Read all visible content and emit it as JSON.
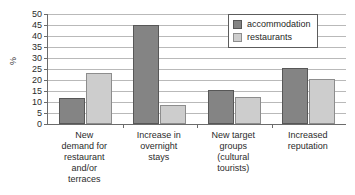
{
  "chart_data": {
    "type": "bar",
    "title": "",
    "subtitle": "",
    "xlabel": "",
    "ylabel": "%",
    "ylim": [
      0,
      50
    ],
    "ytick_step": 5,
    "yticks": [
      50,
      45,
      40,
      35,
      30,
      25,
      20,
      15,
      10,
      5,
      0
    ],
    "grid": true,
    "legend_position": "top-right",
    "categories": [
      "New demand for restaurant and/or terraces",
      "Increase in overnight stays",
      "New target groups (cultural tourists)",
      "Increased reputation"
    ],
    "category_lines": [
      [
        "New",
        "demand for",
        "restaurant",
        "and/or",
        "terraces"
      ],
      [
        "Increase in",
        "overnight",
        "stays"
      ],
      [
        "New target",
        "groups",
        "(cultural",
        "tourists)"
      ],
      [
        "Increased",
        "reputation"
      ]
    ],
    "series": [
      {
        "name": "accommodation",
        "color": "#848484",
        "values": [
          12,
          45,
          15.5,
          25.5
        ]
      },
      {
        "name": "restaurants",
        "color": "#cdcdcd",
        "values": [
          23,
          8.5,
          12.5,
          20.5
        ]
      }
    ]
  },
  "legend": {
    "items": [
      {
        "label": "accommodation",
        "swatch": "accommodation-swatch-icon"
      },
      {
        "label": "restaurants",
        "swatch": "restaurants-swatch-icon"
      }
    ]
  },
  "axis": {
    "y_title": "%"
  }
}
